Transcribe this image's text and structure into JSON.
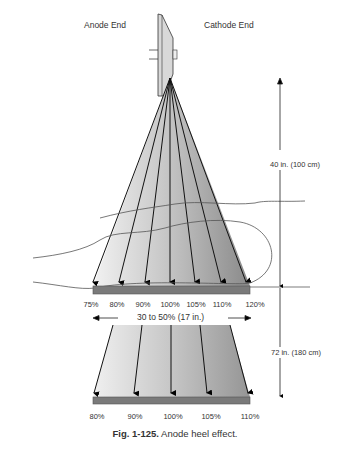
{
  "labels": {
    "anode_end": "Anode End",
    "cathode_end": "Cathode End",
    "distance_upper": "40 in. (100 cm)",
    "distance_lower": "72 in. (180 cm)",
    "variation": "30 to 50% (17 in.)"
  },
  "upper_intensities": [
    "75%",
    "80%",
    "90%",
    "100%",
    "105%",
    "110%",
    "120%"
  ],
  "lower_intensities": [
    "80%",
    "90%",
    "100%",
    "105%",
    "110%"
  ],
  "caption": {
    "number": "Fig. 1-125.",
    "text": "Anode heel effect."
  },
  "colors": {
    "beam_light": "#efefef",
    "beam_dark": "#8f8f8f",
    "receptor": "#7a7a7a",
    "line": "#111111"
  }
}
